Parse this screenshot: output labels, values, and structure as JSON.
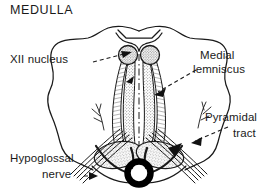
{
  "figure": {
    "title": "MEDULLA",
    "type": "anatomical-line-drawing",
    "background_color": "#ffffff",
    "ink_color": "#1a1a1a",
    "stipple_color": "#4a4a4a",
    "labels": [
      {
        "id": "xii-nucleus",
        "text": "XII nucleus",
        "side": "left",
        "leader": "dashed-with-arrowhead",
        "points_to": "hypoglossal-nucleus-left"
      },
      {
        "id": "medial-lemniscus",
        "text_line_1": "Medial",
        "text_line_2": "lemniscus",
        "side": "right",
        "leader": "dashed-with-arrowhead",
        "points_to": "medial-lemniscus-right"
      },
      {
        "id": "pyramidal-tract",
        "text_line_1": "Pyramidal",
        "text_line_2": "tract",
        "side": "right",
        "leader": "dashed-with-arrowhead",
        "points_to": "pyramid-right"
      },
      {
        "id": "hypoglossal-nerve",
        "text_line_1": "Hypoglossal",
        "text_line_2": "nerve",
        "side": "left",
        "leader": "dashed-with-arrowhead",
        "points_to": "hypoglossal-nerve-rootlets-left"
      }
    ],
    "structures": [
      "medulla-outline",
      "fourth-ventricle",
      "hypoglossal-nucleus-left",
      "hypoglossal-nucleus-right",
      "medial-lemniscus-left",
      "medial-lemniscus-right",
      "pyramid-left",
      "pyramid-right",
      "anterior-median-fissure",
      "anterior-spinal-artery",
      "hypoglossal-nerve-rootlets-left",
      "hypoglossal-nerve-rootlets-right",
      "vessel-branch-left",
      "vessel-branch-right"
    ]
  }
}
